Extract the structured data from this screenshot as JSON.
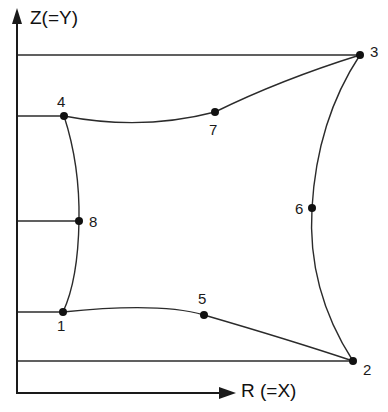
{
  "figure": {
    "type": "technical-geometry-diagram",
    "background_color": "#ffffff",
    "line_color": "#2b2b2b",
    "node_color": "#111111"
  },
  "axes": {
    "y_axis": {
      "label": "Z(=Y)",
      "arrow": "up-arrow-icon",
      "x": 17,
      "top": 22,
      "bottom": 393
    },
    "x_axis": {
      "label": "R (=X)",
      "arrow": "right-arrow-icon",
      "y": 393,
      "left": 17,
      "right": 232
    }
  },
  "gridlines": [
    {
      "name": "gridline-to-node-3",
      "y": 55,
      "x_start": 17,
      "x_end": 360
    },
    {
      "name": "gridline-to-node-4",
      "y": 116,
      "x_start": 17,
      "x_end": 64
    },
    {
      "name": "gridline-to-node-8",
      "y": 221,
      "x_start": 17,
      "x_end": 79
    },
    {
      "name": "gridline-to-node-1",
      "y": 312,
      "x_start": 17,
      "x_end": 63
    },
    {
      "name": "gridline-to-node-2",
      "y": 361,
      "x_start": 17,
      "x_end": 353
    }
  ],
  "nodes": [
    {
      "id": "1",
      "label": "1",
      "x": 63,
      "y": 312,
      "label_x": 57,
      "label_y": 318,
      "kind": "corner"
    },
    {
      "id": "2",
      "label": "2",
      "x": 353,
      "y": 361,
      "label_x": 363,
      "label_y": 362,
      "kind": "corner"
    },
    {
      "id": "3",
      "label": "3",
      "x": 360,
      "y": 55,
      "label_x": 370,
      "label_y": 44,
      "kind": "corner"
    },
    {
      "id": "4",
      "label": "4",
      "x": 64,
      "y": 116,
      "label_x": 57,
      "label_y": 94,
      "kind": "corner"
    },
    {
      "id": "5",
      "label": "5",
      "x": 204,
      "y": 315,
      "label_x": 198,
      "label_y": 291,
      "kind": "midside"
    },
    {
      "id": "6",
      "label": "6",
      "x": 312,
      "y": 208,
      "label_x": 295,
      "label_y": 201,
      "kind": "midside"
    },
    {
      "id": "7",
      "label": "7",
      "x": 215,
      "y": 112,
      "label_x": 209,
      "label_y": 122,
      "kind": "midside"
    },
    {
      "id": "8",
      "label": "8",
      "x": 79,
      "y": 221,
      "label_x": 89,
      "label_y": 214,
      "kind": "midside"
    }
  ],
  "edges": [
    {
      "name": "edge-1-5-2",
      "from": "1",
      "mid": "5",
      "to": "2",
      "path": "M 63 312 Q 160 302 204 315 Q 290 340 353 361"
    },
    {
      "name": "edge-2-6-3",
      "from": "2",
      "mid": "6",
      "to": "3",
      "path": "M 353 361 Q 307 290 312 208 Q 317 120 360 55"
    },
    {
      "name": "edge-3-7-4",
      "from": "3",
      "mid": "7",
      "to": "4",
      "path": "M 360 55 Q 280 80 215 112 Q 142 131 64 116"
    },
    {
      "name": "edge-4-8-1",
      "from": "4",
      "mid": "8",
      "to": "1",
      "path": "M 64 116 Q 80 165 79 221 Q 78 280 63 312"
    }
  ]
}
